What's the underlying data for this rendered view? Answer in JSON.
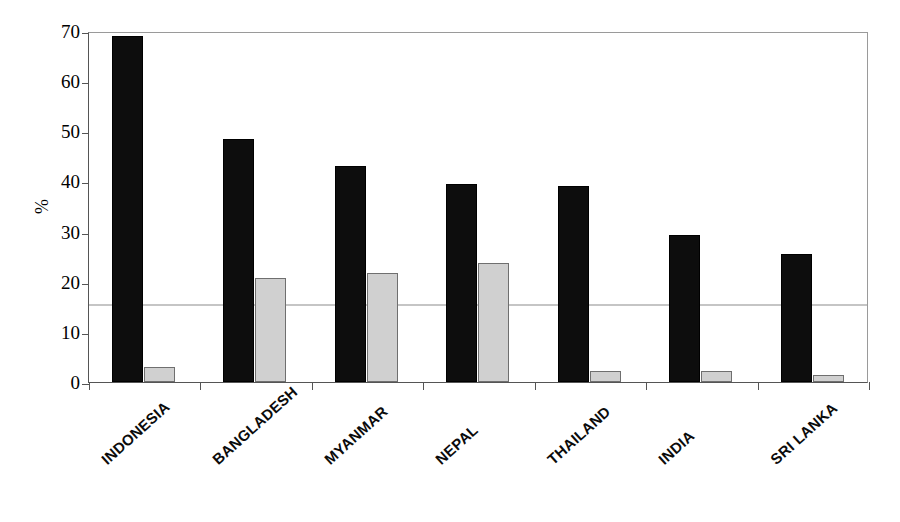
{
  "chart_data": {
    "type": "bar",
    "title": "",
    "subtitle": "",
    "xlabel": "",
    "ylabel": "%",
    "ylim": [
      0,
      70
    ],
    "yticks": [
      0,
      10,
      20,
      30,
      40,
      50,
      60,
      70
    ],
    "ytick_labels": [
      "0",
      "10",
      "20",
      "30",
      "40",
      "50",
      "60",
      "70"
    ],
    "grid": false,
    "legend": "none",
    "categories": [
      "INDONESIA",
      "BANGLADESH",
      "MYANMAR",
      "NEPAL",
      "THAILAND",
      "INDIA",
      "SRI LANKA"
    ],
    "series": [
      {
        "name": "series-1",
        "color": "#0d0d0d",
        "style": "solid-black",
        "values": [
          69.0,
          48.5,
          43.0,
          39.5,
          39.0,
          29.3,
          25.5
        ]
      },
      {
        "name": "series-2",
        "color": "#d0d0d0",
        "style": "light-gray",
        "values": [
          3.0,
          20.8,
          21.7,
          23.7,
          2.2,
          2.2,
          1.4
        ]
      }
    ],
    "annotations": []
  },
  "axes": {
    "y_title": "%",
    "y_tick_labels": [
      "70",
      "60",
      "50",
      "40",
      "30",
      "20",
      "10",
      "0"
    ],
    "x_tick_labels": [
      "INDONESIA",
      "BANGLADESH",
      "MYANMAR",
      "NEPAL",
      "THAILAND",
      "INDIA",
      "SRI LANKA"
    ]
  },
  "colors": {
    "series_1": "#0d0d0d",
    "series_2": "#d0d0d0",
    "axis": "#555555",
    "frame": "#9a9a9a",
    "background": "#ffffff",
    "text": "#000000"
  }
}
